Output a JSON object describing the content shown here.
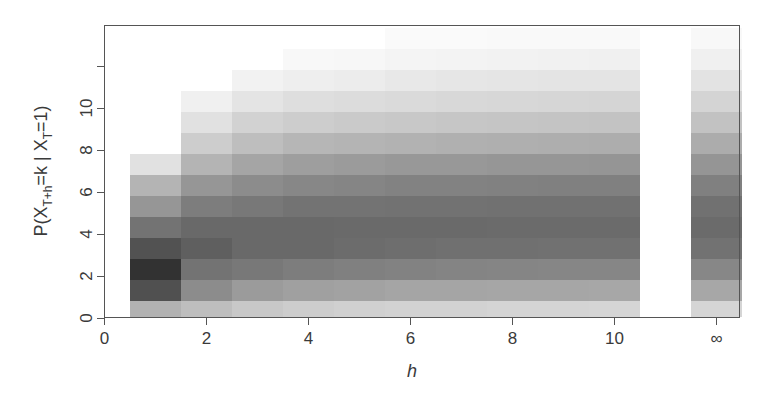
{
  "chart_data": {
    "type": "heatmap",
    "title": "",
    "xlabel": "h",
    "ylabel_parts": {
      "pre": "P(X",
      "sub1": "T+h",
      "mid": "=k | X",
      "sub2": "T",
      "post": "=1)"
    },
    "ylabel": "P(X_{T+h}=k | X_T=1)",
    "x_ticks": [
      "0",
      "2",
      "4",
      "6",
      "8",
      "10",
      "∞"
    ],
    "x_tick_positions": [
      0,
      2,
      4,
      6,
      8,
      10,
      12
    ],
    "y_ticks": [
      "0",
      "2",
      "4",
      "6",
      "8",
      "10",
      ""
    ],
    "y_tick_positions": [
      0,
      2,
      4,
      6,
      8,
      10,
      12
    ],
    "xlim": [
      0,
      12.5
    ],
    "ylim": [
      -0.5,
      13.5
    ],
    "grid": false,
    "columns": [
      "1",
      "2",
      "3",
      "4",
      "5",
      "6",
      "7",
      "8",
      "9",
      "10",
      "∞"
    ],
    "column_positions": [
      1,
      2,
      3,
      4,
      5,
      6,
      7,
      8,
      9,
      10,
      12
    ],
    "k_values": [
      0,
      1,
      2,
      3,
      4,
      5,
      6,
      7,
      8,
      9,
      10,
      11,
      12,
      13
    ],
    "grey_levels_note": "0=black (high probability), 255=white (zero probability); per column, bottom (k=0) to top",
    "grey_levels": [
      [
        178,
        80,
        50,
        82,
        115,
        150,
        180,
        225
      ],
      [
        190,
        140,
        115,
        95,
        105,
        125,
        150,
        180,
        205,
        225,
        240
      ],
      [
        200,
        155,
        120,
        105,
        105,
        120,
        140,
        165,
        190,
        210,
        228,
        242
      ],
      [
        205,
        160,
        125,
        105,
        105,
        115,
        135,
        158,
        182,
        205,
        222,
        238,
        248
      ],
      [
        208,
        162,
        128,
        108,
        106,
        115,
        133,
        155,
        180,
        202,
        220,
        236,
        247
      ],
      [
        210,
        165,
        130,
        110,
        106,
        114,
        130,
        152,
        178,
        200,
        218,
        232,
        244,
        250
      ],
      [
        210,
        165,
        132,
        112,
        106,
        114,
        130,
        152,
        176,
        198,
        216,
        230,
        243,
        250
      ],
      [
        212,
        166,
        133,
        112,
        107,
        113,
        129,
        150,
        175,
        197,
        215,
        229,
        242,
        249
      ],
      [
        212,
        166,
        134,
        113,
        107,
        113,
        128,
        150,
        174,
        196,
        214,
        228,
        241,
        249
      ],
      [
        213,
        167,
        134,
        113,
        107,
        113,
        128,
        149,
        173,
        195,
        213,
        228,
        240,
        249
      ],
      [
        213,
        167,
        135,
        114,
        107,
        113,
        128,
        149,
        172,
        194,
        212,
        227,
        240,
        248
      ]
    ]
  }
}
